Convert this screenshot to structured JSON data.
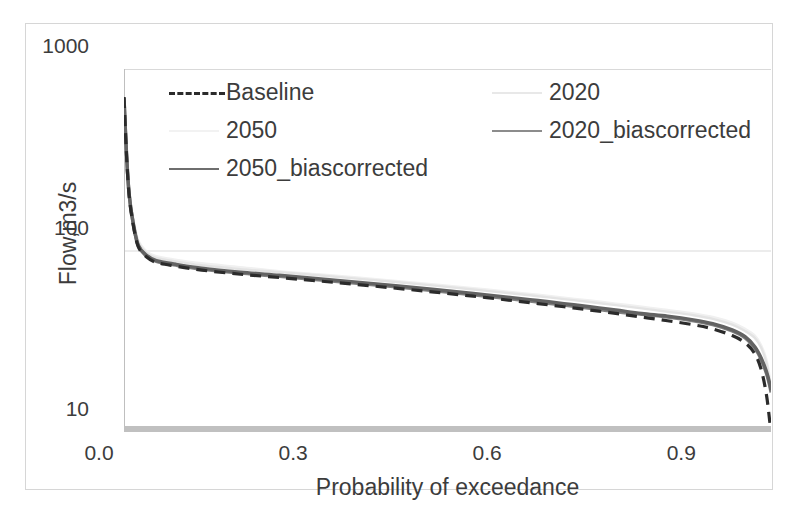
{
  "chart_data": {
    "type": "line",
    "title": "",
    "xlabel": "Probability of exceedance",
    "ylabel": "Flow,m3/s",
    "yscale": "log",
    "ylim": [
      10,
      1000
    ],
    "xlim": [
      0.0,
      1.0
    ],
    "xticks": [
      "0.0",
      "0.3",
      "0.6",
      "0.9"
    ],
    "xtick_values": [
      0.0,
      0.3,
      0.6,
      0.9
    ],
    "yticks": [
      "10",
      "100",
      "1000"
    ],
    "ytick_values": [
      10,
      100,
      1000
    ],
    "grid": "horizontal",
    "legend_position": "top-inside",
    "series": [
      {
        "name": "Baseline",
        "style": "dashed",
        "color": "#2b2b2b",
        "width": 3.2,
        "x": [
          0.0,
          0.004,
          0.008,
          0.014,
          0.022,
          0.035,
          0.05,
          0.08,
          0.12,
          0.18,
          0.24,
          0.3,
          0.36,
          0.42,
          0.48,
          0.54,
          0.6,
          0.64,
          0.68,
          0.72,
          0.76,
          0.8,
          0.84,
          0.88,
          0.91,
          0.94,
          0.96,
          0.975,
          0.985,
          0.993,
          0.998,
          1.0
        ],
        "y": [
          700,
          330,
          200,
          140,
          105,
          92,
          86,
          82,
          78,
          74,
          71,
          68,
          65,
          62,
          59,
          56,
          53,
          51,
          49,
          47,
          45,
          43,
          41,
          39,
          37,
          34,
          31,
          27,
          22,
          16,
          11.5,
          10.0
        ]
      },
      {
        "name": "2020",
        "style": "solid",
        "color": "#e3e3e3",
        "width": 2.4,
        "x": [
          0.0,
          0.004,
          0.008,
          0.014,
          0.022,
          0.035,
          0.05,
          0.08,
          0.12,
          0.18,
          0.24,
          0.3,
          0.36,
          0.42,
          0.48,
          0.54,
          0.6,
          0.64,
          0.68,
          0.72,
          0.76,
          0.8,
          0.84,
          0.88,
          0.91,
          0.94,
          0.96,
          0.975,
          0.985,
          0.993,
          0.998,
          1.0
        ],
        "y": [
          690,
          340,
          210,
          150,
          112,
          97,
          91,
          87,
          83,
          79,
          76,
          73,
          70,
          67,
          64,
          61,
          58,
          56,
          54,
          52,
          50,
          48,
          46,
          44,
          42,
          39,
          36,
          33,
          29,
          24,
          19,
          17.0
        ]
      },
      {
        "name": "2050",
        "style": "solid",
        "color": "#f0f0f0",
        "width": 2.4,
        "x": [
          0.0,
          0.004,
          0.008,
          0.014,
          0.022,
          0.035,
          0.05,
          0.08,
          0.12,
          0.18,
          0.24,
          0.3,
          0.36,
          0.42,
          0.48,
          0.54,
          0.6,
          0.64,
          0.68,
          0.72,
          0.76,
          0.8,
          0.84,
          0.88,
          0.91,
          0.94,
          0.96,
          0.975,
          0.985,
          0.993,
          0.998,
          1.0
        ],
        "y": [
          700,
          345,
          215,
          152,
          114,
          99,
          93,
          89,
          85,
          81,
          77,
          74,
          71,
          68,
          65,
          62,
          59,
          57,
          55,
          53,
          51,
          49,
          47,
          45,
          43,
          40,
          37,
          34,
          30,
          25,
          20,
          17.5
        ]
      },
      {
        "name": "2020_biascorrected",
        "style": "solid",
        "color": "#808080",
        "width": 3.4,
        "x": [
          0.0,
          0.004,
          0.008,
          0.014,
          0.022,
          0.035,
          0.05,
          0.08,
          0.12,
          0.18,
          0.24,
          0.3,
          0.36,
          0.42,
          0.48,
          0.54,
          0.6,
          0.64,
          0.68,
          0.72,
          0.76,
          0.8,
          0.84,
          0.88,
          0.91,
          0.94,
          0.96,
          0.975,
          0.985,
          0.993,
          0.998,
          1.0
        ],
        "y": [
          690,
          332,
          202,
          142,
          106,
          93,
          87,
          83,
          79,
          75,
          72,
          69,
          66,
          63,
          60,
          57,
          54,
          52,
          50,
          48,
          46,
          44.5,
          43,
          41,
          39,
          36,
          33,
          29,
          25,
          21,
          18,
          16.5
        ]
      },
      {
        "name": "2050_biascorrected",
        "style": "solid",
        "color": "#636363",
        "width": 3.4,
        "x": [
          0.0,
          0.004,
          0.008,
          0.014,
          0.022,
          0.035,
          0.05,
          0.08,
          0.12,
          0.18,
          0.24,
          0.3,
          0.36,
          0.42,
          0.48,
          0.54,
          0.6,
          0.64,
          0.68,
          0.72,
          0.76,
          0.8,
          0.84,
          0.88,
          0.91,
          0.94,
          0.96,
          0.975,
          0.985,
          0.993,
          0.998,
          1.0
        ],
        "y": [
          695,
          335,
          204,
          143,
          107,
          94,
          88,
          84,
          80,
          76,
          73,
          70,
          67,
          64,
          61,
          58,
          55,
          53,
          51,
          49,
          47,
          45,
          43.5,
          41.5,
          39.5,
          36.5,
          33.5,
          29.5,
          25.5,
          21.5,
          18.5,
          17.0
        ]
      }
    ],
    "baseline_band": {
      "label": "axis-baseline-band",
      "color": "#c0c0c0",
      "y_value": 10,
      "x_from": 0.0,
      "x_to": 1.0
    }
  },
  "legend": {
    "items": [
      {
        "label": "Baseline",
        "color": "#2b2b2b",
        "style": "dashed",
        "width": 3.2,
        "col": 0,
        "row": 0
      },
      {
        "label": "2020",
        "color": "#e8e8e8",
        "style": "solid",
        "width": 2.2,
        "col": 1,
        "row": 0
      },
      {
        "label": "2050",
        "color": "#f2f2f2",
        "style": "solid",
        "width": 2.2,
        "col": 0,
        "row": 1
      },
      {
        "label": "2020_biascorrected",
        "color": "#8c8c8c",
        "style": "solid",
        "width": 2.6,
        "col": 1,
        "row": 1
      },
      {
        "label": "2050_biascorrected",
        "color": "#6e6e6e",
        "style": "solid",
        "width": 2.6,
        "col": 0,
        "row": 2
      }
    ]
  },
  "axes": {
    "y_title": "Flow,m3/s",
    "x_title": "Probability of exceedance",
    "y_tick_labels": [
      "1000",
      "100",
      "10"
    ],
    "x_tick_labels": [
      "0.0",
      "0.3",
      "0.6",
      "0.9"
    ]
  },
  "colors": {
    "frame": "#d6d6d6",
    "gridline": "#d9d9d9",
    "axis_line": "#bfbfbf",
    "text": "#3c3c3c",
    "background": "#ffffff"
  }
}
